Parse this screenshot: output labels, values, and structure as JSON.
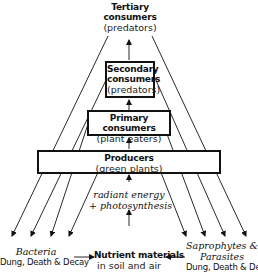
{
  "diagram": {
    "type": "ecological energy pyramid / nutrient cycle",
    "levels": [
      {
        "id": "tertiary",
        "title_line1": "Tertiary",
        "title_line2": "consumers",
        "subtitle": "(predators)"
      },
      {
        "id": "secondary",
        "title_line1": "Secondary",
        "title_line2": "consumers",
        "subtitle": "(predators)"
      },
      {
        "id": "primary",
        "title": "Primary consumers",
        "subtitle": "(plant eaters)"
      },
      {
        "id": "producers",
        "title": "Producers",
        "subtitle": "(green plants)"
      }
    ],
    "energy_input": {
      "line1": "radiant energy",
      "line2": "+ photosynthesis"
    },
    "bottom": {
      "left": {
        "title": "Bacteria",
        "subtitle": "Dung, Death & Decay"
      },
      "center": {
        "title": "Nutrient materials",
        "subtitle": "in soil and air"
      },
      "right": {
        "title_line1": "Saprophytes &",
        "title_line2": "Parasites",
        "subtitle": "Dung, Death & Decay"
      }
    },
    "colors": {
      "ink": "#111111",
      "background": "#ffffff"
    }
  }
}
